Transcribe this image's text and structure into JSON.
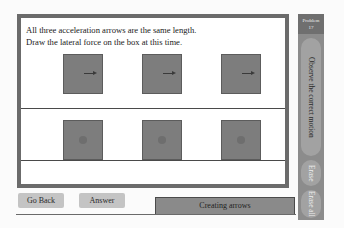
{
  "instructions": {
    "line1": "All three acceleration arrows are the same length.",
    "line2": "Draw the lateral force on the box at this time."
  },
  "scene": {
    "top_row": [
      {
        "box": "box-1",
        "arrow_direction": "right"
      },
      {
        "box": "box-2",
        "arrow_direction": "right"
      },
      {
        "box": "box-3",
        "arrow_direction": "right"
      }
    ],
    "bottom_row": [
      {
        "box": "box-1",
        "marker": "dot"
      },
      {
        "box": "box-2",
        "marker": "dot"
      },
      {
        "box": "box-3",
        "marker": "dot"
      }
    ]
  },
  "buttons": {
    "go_back": "Go Back",
    "answer": "Answer"
  },
  "status": {
    "mode": "Creating arrows"
  },
  "sidebar": {
    "problem_label": "Problem",
    "problem_number": "17",
    "observe_motion": "Observe the correct motion",
    "erase": "Erase",
    "erase_all": "Erase all"
  },
  "colors": {
    "panel_border": "#6b6b6b",
    "box_fill": "#7d7d7d",
    "button_bg": "#c4c4c4",
    "sidebar_bg": "#8c8c8c",
    "status_bg": "#8a8a8a"
  }
}
